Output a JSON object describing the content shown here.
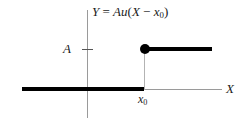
{
  "figure": {
    "type": "unit-step-function-plot",
    "background_color": "#ffffff",
    "curve_color": "#000000",
    "axis_color": "#9a9a9a"
  },
  "title": {
    "lhs": "Y",
    "equals": " = ",
    "amplitude": "A",
    "step_fn": "u",
    "open_paren": "(",
    "variable": "X",
    "minus": " − ",
    "shift_base": "x",
    "shift_sub": "0",
    "close_paren": ")",
    "full_text": "Y = Au(X − x0)"
  },
  "axes": {
    "x_label": "X",
    "y_tick_label": "A",
    "x_tick_base": "x",
    "x_tick_sub": "0"
  },
  "chart_data": {
    "type": "line",
    "title": "Y = Au(X − x0)",
    "xlabel": "X",
    "ylabel": "",
    "series": [
      {
        "name": "Au(X − x0)",
        "points": [
          {
            "x": "-∞",
            "y": 0
          },
          {
            "x": "x0⁻",
            "y": 0
          },
          {
            "x": "x0",
            "y": "A"
          },
          {
            "x": "+∞",
            "y": "A"
          }
        ]
      }
    ],
    "annotations": [
      {
        "name": "step-discontinuity-dot",
        "x": "x0",
        "y": "A",
        "marker": "filled-circle"
      },
      {
        "name": "amplitude-tick",
        "axis": "y",
        "value": "A"
      },
      {
        "name": "shift-tick",
        "axis": "x",
        "value": "x0"
      }
    ],
    "grid": false,
    "legend": "none"
  }
}
